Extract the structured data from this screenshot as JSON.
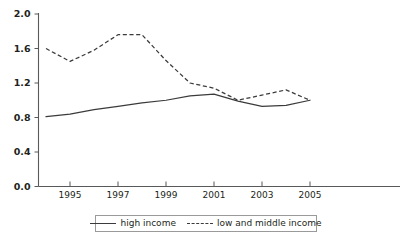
{
  "chart_data": {
    "type": "line",
    "title": "",
    "subtitle": "",
    "xlabel": "",
    "ylabel": "",
    "xlim": [
      1994,
      2005
    ],
    "ylim": [
      0.0,
      2.0
    ],
    "grid": false,
    "legend_position": "bottom",
    "x_ticks": [
      "1995",
      "1997",
      "1999",
      "2001",
      "2003",
      "2005"
    ],
    "x_tick_values": [
      1995,
      1997,
      1999,
      2001,
      2003,
      2005
    ],
    "y_ticks": [
      "0.0",
      "0.4",
      "0.8",
      "1.2",
      "1.6",
      "2.0"
    ],
    "y_tick_values": [
      0.0,
      0.4,
      0.8,
      1.2,
      1.6,
      2.0
    ],
    "x": [
      1994,
      1995,
      1996,
      1997,
      1998,
      1999,
      2000,
      2001,
      2002,
      2003,
      2004,
      2005
    ],
    "series": [
      {
        "name": "high income",
        "style": "solid",
        "color": "#3b3b3d",
        "values": [
          0.81,
          0.84,
          0.89,
          0.93,
          0.97,
          1.0,
          1.05,
          1.07,
          0.99,
          0.93,
          0.94,
          1.0
        ]
      },
      {
        "name": "low and middle income",
        "style": "dashed",
        "color": "#3b3b3d",
        "values": [
          1.6,
          1.45,
          1.58,
          1.76,
          1.76,
          1.46,
          1.2,
          1.14,
          1.0,
          1.06,
          1.12,
          1.0
        ]
      }
    ]
  },
  "legend": {
    "items": [
      {
        "label": "high income",
        "style": "solid"
      },
      {
        "label": "low and middle income",
        "style": "dashed"
      }
    ]
  },
  "axes": {
    "y_labels": [
      "2.0",
      "1.6",
      "1.2",
      "0.8",
      "0.4",
      "0.0"
    ],
    "x_labels": [
      "1995",
      "1997",
      "1999",
      "2001",
      "2003",
      "2005"
    ]
  },
  "colors": {
    "line": "#3b3b3d",
    "axis": "#58595b",
    "text": "#231f20",
    "background": "#ffffff",
    "legend_border": "#9a9a9a"
  }
}
